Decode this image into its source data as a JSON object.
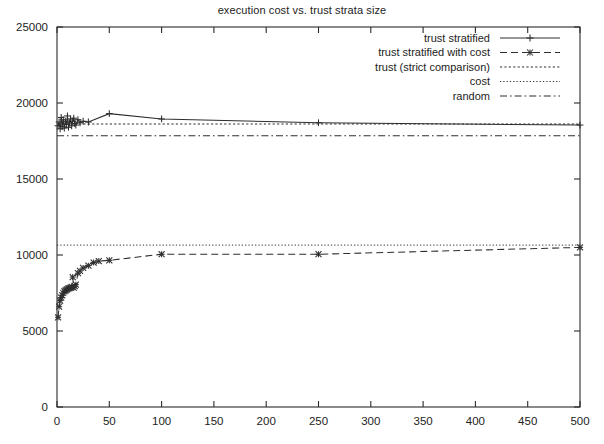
{
  "chart_data": {
    "type": "line",
    "title": "execution cost vs. trust strata size",
    "xlabel": "",
    "ylabel": "",
    "xlim": [
      0,
      500
    ],
    "ylim": [
      0,
      25000
    ],
    "xticks": [
      0,
      50,
      100,
      150,
      200,
      250,
      300,
      350,
      400,
      450,
      500
    ],
    "yticks": [
      0,
      5000,
      10000,
      15000,
      20000,
      25000
    ],
    "xtick_labels": [
      "0",
      "50",
      "100",
      "150",
      "200",
      "250",
      "300",
      "350",
      "400",
      "450",
      "500"
    ],
    "ytick_labels": [
      "0",
      "5000",
      "10000",
      "15000",
      "20000",
      "25000"
    ],
    "grid": false,
    "legend_position": "top-right",
    "series": [
      {
        "name": "trust stratified",
        "style": "solid",
        "marker": "plus",
        "x": [
          1,
          2,
          3,
          4,
          5,
          6,
          7,
          8,
          9,
          10,
          11,
          12,
          13,
          14,
          15,
          16,
          17,
          18,
          20,
          22,
          25,
          30,
          50,
          100,
          250,
          500
        ],
        "y": [
          18500,
          18750,
          18300,
          19050,
          18450,
          18900,
          18350,
          18800,
          18600,
          19150,
          18400,
          18700,
          18950,
          18500,
          18800,
          19000,
          18650,
          18550,
          18900,
          18700,
          18800,
          18750,
          19300,
          18950,
          18700,
          18550
        ]
      },
      {
        "name": "trust stratified with cost",
        "style": "dashed",
        "marker": "cross",
        "x": [
          1,
          2,
          3,
          4,
          5,
          6,
          7,
          8,
          9,
          10,
          11,
          12,
          13,
          14,
          15,
          16,
          17,
          18,
          20,
          22,
          25,
          30,
          35,
          40,
          50,
          100,
          250,
          500
        ],
        "y": [
          5900,
          6600,
          7000,
          7200,
          7350,
          7500,
          7600,
          7650,
          7700,
          7750,
          7800,
          7820,
          7850,
          7900,
          8550,
          7850,
          7950,
          8050,
          8800,
          8950,
          9150,
          9300,
          9500,
          9600,
          9650,
          10050,
          10050,
          10500
        ]
      },
      {
        "name": "trust (strict comparison)",
        "style": "dotted",
        "marker": "none",
        "constant": 18620,
        "x": [
          0,
          500
        ],
        "y": [
          18620,
          18620
        ]
      },
      {
        "name": "cost",
        "style": "fine-dotted",
        "marker": "none",
        "constant": 10650,
        "x": [
          0,
          500
        ],
        "y": [
          10650,
          10650
        ]
      },
      {
        "name": "random",
        "style": "dash-dot",
        "marker": "none",
        "constant": 17850,
        "x": [
          0,
          500
        ],
        "y": [
          17850,
          17850
        ]
      }
    ]
  },
  "legend": {
    "entries": [
      {
        "label": "trust stratified"
      },
      {
        "label": "trust stratified with cost"
      },
      {
        "label": "trust (strict comparison)"
      },
      {
        "label": "cost"
      },
      {
        "label": "random"
      }
    ]
  },
  "colors": {
    "ink": "#2b2b2b",
    "background": "#ffffff"
  }
}
